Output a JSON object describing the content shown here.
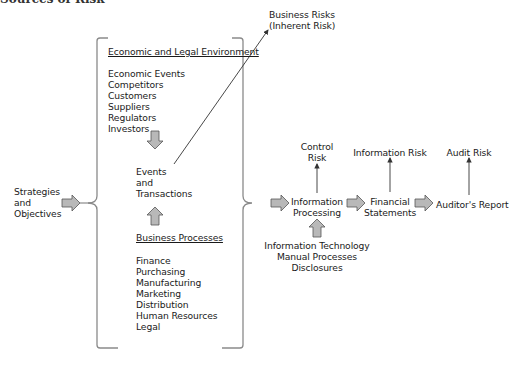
{
  "figure": {
    "title": "Sources of Risk",
    "inputs": {
      "strategies": [
        "Strategies",
        "and",
        "Objectives"
      ]
    },
    "environment": {
      "heading": "Economic and Legal Environment",
      "items": [
        "Economic Events",
        "Competitors",
        "Customers",
        "Suppliers",
        "Regulators",
        "Investors"
      ]
    },
    "events": [
      "Events",
      "and",
      "Transactions"
    ],
    "business_processes": {
      "heading": "Business Processes",
      "items": [
        "Finance",
        "Purchasing",
        "Manufacturing",
        "Marketing",
        "Distribution",
        "Human Resources",
        "Legal"
      ]
    },
    "business_risks": [
      "Business Risks",
      "(Inherent Risk)"
    ],
    "control_risk": [
      "Control",
      "Risk"
    ],
    "information_processing": [
      "Information",
      "Processing"
    ],
    "processing_inputs": [
      "Information Technology",
      "Manual Processes",
      "Disclosures"
    ],
    "information_risk": "Information Risk",
    "financial_statements": [
      "Financial",
      "Statements"
    ],
    "audit_risk": "Audit Risk",
    "auditors_report": "Auditor's Report"
  },
  "colors": {
    "arrow_fill": "#b8b8b8",
    "arrow_stroke": "#555555",
    "line": "#555555",
    "bracket": "#8a8a8a",
    "text": "#1a1a1a"
  }
}
